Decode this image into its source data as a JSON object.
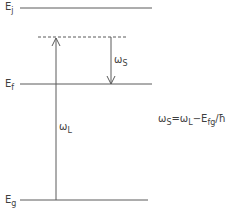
{
  "diagram": {
    "type": "energy-level-diagram",
    "levels": [
      {
        "id": "Ej",
        "label_main": "E",
        "label_sub": "j",
        "y": 8,
        "style": "solid"
      },
      {
        "id": "virtual",
        "label_main": "",
        "label_sub": "",
        "y": 37,
        "style": "dashed"
      },
      {
        "id": "Ef",
        "label_main": "E",
        "label_sub": "f",
        "y": 84,
        "style": "solid"
      },
      {
        "id": "Eg",
        "label_main": "E",
        "label_sub": "g",
        "y": 200,
        "style": "solid"
      }
    ],
    "arrows": [
      {
        "id": "omega_L",
        "direction": "up",
        "from": "Eg",
        "to": "virtual",
        "label_main": "ω",
        "label_sub": "L"
      },
      {
        "id": "omega_S",
        "direction": "down",
        "from": "virtual",
        "to": "Ef",
        "label_main": "ω",
        "label_sub": "S"
      }
    ],
    "equation": {
      "lhs_main": "ω",
      "lhs_sub": "S",
      "eq": "=",
      "rhs1_main": "ω",
      "rhs1_sub": "L",
      "minus": "−",
      "rhs2_main": "E",
      "rhs2_sub": "fg",
      "slash": "/",
      "hbar": "ħ"
    },
    "colors": {
      "line": "#5a5a5a",
      "text": "#3f3f3f",
      "background": "#ffffff"
    }
  }
}
